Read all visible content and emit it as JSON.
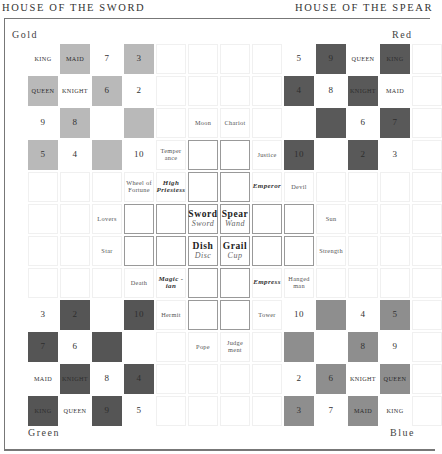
{
  "headers": {
    "left": "HOUSE OF THE SWORD",
    "right": "HOUSE OF THE SPEAR"
  },
  "corners": {
    "top_left": "Gold",
    "top_right": "Red",
    "bottom_left": "Green",
    "bottom_right": "Blue"
  },
  "colors": {
    "gold_square": "#b9b9b9",
    "red_square": "#595959",
    "green_square": "#555555",
    "blue_square": "#8e8e8e",
    "frame": "#777777"
  },
  "board": {
    "rows": 12,
    "cols": 13,
    "cells": [
      [
        {
          "t": "KING",
          "k": "rank",
          "s": "w"
        },
        {
          "t": "MAID",
          "k": "rank",
          "s": "lg"
        },
        {
          "t": "7",
          "k": "num",
          "s": "w"
        },
        {
          "t": "3",
          "k": "num",
          "s": "lg"
        },
        {
          "t": "",
          "s": "e"
        },
        {
          "t": "",
          "s": "e"
        },
        {
          "t": "",
          "s": "e"
        },
        {
          "t": "",
          "s": "e"
        },
        {
          "t": "5",
          "k": "num",
          "s": "w"
        },
        {
          "t": "9",
          "k": "num",
          "s": "dk"
        },
        {
          "t": "QUEEN",
          "k": "rank",
          "s": "w"
        },
        {
          "t": "KING",
          "k": "rank",
          "s": "dk"
        },
        {
          "t": "",
          "s": "e"
        }
      ],
      [
        {
          "t": "QUEEN",
          "k": "rank",
          "s": "lg"
        },
        {
          "t": "KNIGHT",
          "k": "rank",
          "s": "w"
        },
        {
          "t": "6",
          "k": "num",
          "s": "lg"
        },
        {
          "t": "2",
          "k": "num",
          "s": "w"
        },
        {
          "t": "",
          "s": "e"
        },
        {
          "t": "",
          "s": "e"
        },
        {
          "t": "",
          "s": "e"
        },
        {
          "t": "",
          "s": "e"
        },
        {
          "t": "4",
          "k": "num",
          "s": "dk"
        },
        {
          "t": "8",
          "k": "num",
          "s": "w"
        },
        {
          "t": "KNIGHT",
          "k": "rank",
          "s": "dk"
        },
        {
          "t": "MAID",
          "k": "rank",
          "s": "w"
        },
        {
          "t": "",
          "s": "e"
        }
      ],
      [
        {
          "t": "9",
          "k": "num",
          "s": "w"
        },
        {
          "t": "8",
          "k": "num",
          "s": "lg"
        },
        {
          "t": "",
          "s": "w"
        },
        {
          "t": "",
          "s": "lg"
        },
        {
          "t": "",
          "s": "e"
        },
        {
          "t": "Moon",
          "k": "trump",
          "s": "e"
        },
        {
          "t": "Chariot",
          "k": "trump",
          "s": "e"
        },
        {
          "t": "",
          "s": "e"
        },
        {
          "t": "",
          "s": "w"
        },
        {
          "t": "",
          "s": "dk"
        },
        {
          "t": "6",
          "k": "num",
          "s": "w"
        },
        {
          "t": "7",
          "k": "num",
          "s": "dk"
        },
        {
          "t": "",
          "s": "e"
        }
      ],
      [
        {
          "t": "5",
          "k": "num",
          "s": "lg"
        },
        {
          "t": "4",
          "k": "num",
          "s": "w"
        },
        {
          "t": "",
          "s": "lg"
        },
        {
          "t": "10",
          "k": "num",
          "s": "w"
        },
        {
          "t": "Temper ance",
          "k": "trump",
          "s": "e"
        },
        {
          "t": "",
          "s": "box"
        },
        {
          "t": "",
          "s": "box"
        },
        {
          "t": "Justice",
          "k": "trump",
          "s": "e"
        },
        {
          "t": "10",
          "k": "num",
          "s": "dk"
        },
        {
          "t": "",
          "s": "w"
        },
        {
          "t": "2",
          "k": "num",
          "s": "dk"
        },
        {
          "t": "3",
          "k": "num",
          "s": "w"
        },
        {
          "t": "",
          "s": "e"
        }
      ],
      [
        {
          "t": "",
          "s": "e"
        },
        {
          "t": "",
          "s": "e"
        },
        {
          "t": "",
          "s": "e"
        },
        {
          "t": "Wheel of Fortune",
          "k": "trump",
          "s": "e"
        },
        {
          "t": "High Priestess",
          "k": "trump-b",
          "s": "e"
        },
        {
          "t": "",
          "s": "box"
        },
        {
          "t": "",
          "s": "box"
        },
        {
          "t": "Emperor",
          "k": "trump-b",
          "s": "e"
        },
        {
          "t": "Devil",
          "k": "trump",
          "s": "e"
        },
        {
          "t": "",
          "s": "e"
        },
        {
          "t": "",
          "s": "e"
        },
        {
          "t": "",
          "s": "e"
        },
        {
          "t": "",
          "s": "e"
        }
      ],
      [
        {
          "t": "",
          "s": "e"
        },
        {
          "t": "",
          "s": "e"
        },
        {
          "t": "Lovers",
          "k": "trump",
          "s": "e"
        },
        {
          "t": "",
          "s": "box"
        },
        {
          "t": "",
          "s": "box"
        },
        {
          "t": "Sword",
          "sub": "Sword",
          "k": "suit",
          "s": "box"
        },
        {
          "t": "Spear",
          "sub": "Wand",
          "k": "suit",
          "s": "box"
        },
        {
          "t": "",
          "s": "box"
        },
        {
          "t": "",
          "s": "box"
        },
        {
          "t": "Sun",
          "k": "trump",
          "s": "e"
        },
        {
          "t": "",
          "s": "e"
        },
        {
          "t": "",
          "s": "e"
        },
        {
          "t": "",
          "s": "e"
        }
      ],
      [
        {
          "t": "",
          "s": "e"
        },
        {
          "t": "",
          "s": "e"
        },
        {
          "t": "Star",
          "k": "trump",
          "s": "e"
        },
        {
          "t": "",
          "s": "box"
        },
        {
          "t": "",
          "s": "box"
        },
        {
          "t": "Dish",
          "sub": "Disc",
          "k": "suit",
          "s": "box"
        },
        {
          "t": "Grail",
          "sub": "Cup",
          "k": "suit",
          "s": "box"
        },
        {
          "t": "",
          "s": "box"
        },
        {
          "t": "",
          "s": "box"
        },
        {
          "t": "Strength",
          "k": "trump",
          "s": "e"
        },
        {
          "t": "",
          "s": "e"
        },
        {
          "t": "",
          "s": "e"
        },
        {
          "t": "",
          "s": "e"
        }
      ],
      [
        {
          "t": "",
          "s": "e"
        },
        {
          "t": "",
          "s": "e"
        },
        {
          "t": "",
          "s": "e"
        },
        {
          "t": "Death",
          "k": "trump",
          "s": "e"
        },
        {
          "t": "Magic -ian",
          "k": "trump-b",
          "s": "e"
        },
        {
          "t": "",
          "s": "box"
        },
        {
          "t": "",
          "s": "box"
        },
        {
          "t": "Empress",
          "k": "trump-b",
          "s": "e"
        },
        {
          "t": "Hanged man",
          "k": "trump",
          "s": "e"
        },
        {
          "t": "",
          "s": "e"
        },
        {
          "t": "",
          "s": "e"
        },
        {
          "t": "",
          "s": "e"
        },
        {
          "t": "",
          "s": "e"
        }
      ],
      [
        {
          "t": "3",
          "k": "num",
          "s": "w"
        },
        {
          "t": "2",
          "k": "num",
          "s": "gd"
        },
        {
          "t": "",
          "s": "w"
        },
        {
          "t": "10",
          "k": "num",
          "s": "gd"
        },
        {
          "t": "Hermit",
          "k": "trump",
          "s": "e"
        },
        {
          "t": "",
          "s": "box"
        },
        {
          "t": "",
          "s": "box"
        },
        {
          "t": "Tower",
          "k": "trump",
          "s": "e"
        },
        {
          "t": "10",
          "k": "num",
          "s": "w"
        },
        {
          "t": "",
          "s": "mg"
        },
        {
          "t": "4",
          "k": "num",
          "s": "w"
        },
        {
          "t": "5",
          "k": "num",
          "s": "mg"
        },
        {
          "t": "",
          "s": "e"
        }
      ],
      [
        {
          "t": "7",
          "k": "num",
          "s": "gd"
        },
        {
          "t": "6",
          "k": "num",
          "s": "w"
        },
        {
          "t": "",
          "s": "gd"
        },
        {
          "t": "",
          "s": "w"
        },
        {
          "t": "",
          "s": "e"
        },
        {
          "t": "Pope",
          "k": "trump",
          "s": "e"
        },
        {
          "t": "Judge ment",
          "k": "trump",
          "s": "e"
        },
        {
          "t": "",
          "s": "e"
        },
        {
          "t": "",
          "s": "mg"
        },
        {
          "t": "",
          "s": "w"
        },
        {
          "t": "8",
          "k": "num",
          "s": "mg"
        },
        {
          "t": "9",
          "k": "num",
          "s": "w"
        },
        {
          "t": "",
          "s": "e"
        }
      ],
      [
        {
          "t": "MAID",
          "k": "rank",
          "s": "w"
        },
        {
          "t": "KNIGHT",
          "k": "rank",
          "s": "gd"
        },
        {
          "t": "8",
          "k": "num",
          "s": "w"
        },
        {
          "t": "4",
          "k": "num",
          "s": "gd"
        },
        {
          "t": "",
          "s": "e"
        },
        {
          "t": "",
          "s": "e"
        },
        {
          "t": "",
          "s": "e"
        },
        {
          "t": "",
          "s": "e"
        },
        {
          "t": "2",
          "k": "num",
          "s": "w"
        },
        {
          "t": "6",
          "k": "num",
          "s": "mg"
        },
        {
          "t": "KNIGHT",
          "k": "rank",
          "s": "w"
        },
        {
          "t": "QUEEN",
          "k": "rank",
          "s": "mg"
        },
        {
          "t": "",
          "s": "e"
        }
      ],
      [
        {
          "t": "KING",
          "k": "rank",
          "s": "gd"
        },
        {
          "t": "QUEEN",
          "k": "rank",
          "s": "w"
        },
        {
          "t": "9",
          "k": "num",
          "s": "gd"
        },
        {
          "t": "5",
          "k": "num",
          "s": "w"
        },
        {
          "t": "",
          "s": "e"
        },
        {
          "t": "",
          "s": "e"
        },
        {
          "t": "",
          "s": "e"
        },
        {
          "t": "",
          "s": "e"
        },
        {
          "t": "3",
          "k": "num",
          "s": "mg"
        },
        {
          "t": "7",
          "k": "num",
          "s": "w"
        },
        {
          "t": "MAID",
          "k": "rank",
          "s": "mg"
        },
        {
          "t": "KING",
          "k": "rank",
          "s": "w"
        },
        {
          "t": "",
          "s": "e"
        }
      ]
    ]
  }
}
